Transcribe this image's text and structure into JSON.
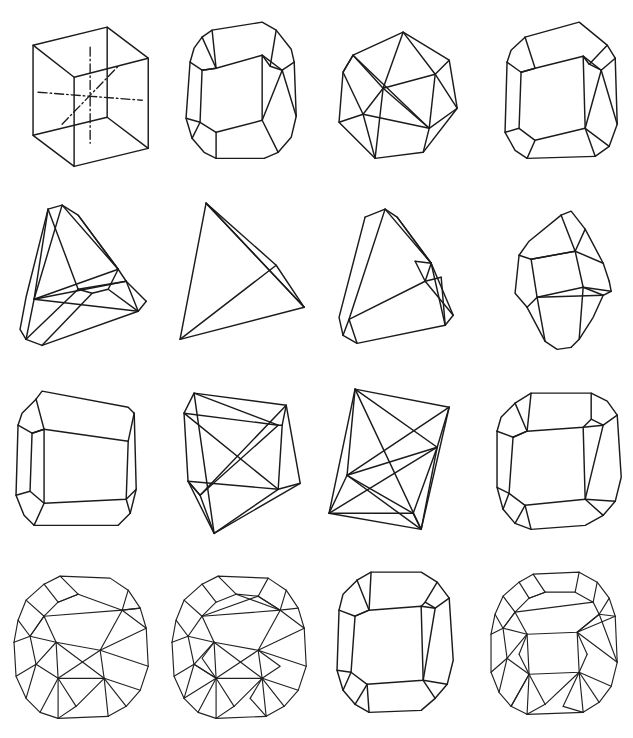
{
  "plate": {
    "title": "",
    "width": 633,
    "height": 738,
    "background_color": "#ffffff",
    "line_color": "#1b1b1b",
    "rows": 4,
    "columns": 4,
    "figure_count": 16
  },
  "figures": [
    {
      "index": 1,
      "row": 1,
      "column": 1,
      "name": "cube-with-symmetry-axes",
      "label": "",
      "form": "hexahedron",
      "has_axes": true,
      "axis_style": "dash-dot"
    },
    {
      "index": 2,
      "row": 1,
      "column": 2,
      "name": "truncated-cube",
      "label": "",
      "form": "cube with bevelled edges and corners",
      "has_axes": false,
      "axis_style": ""
    },
    {
      "index": 3,
      "row": 1,
      "column": 3,
      "name": "cuboctahedron",
      "label": "",
      "form": "cuboctahedron wireframe",
      "has_axes": false,
      "axis_style": ""
    },
    {
      "index": 4,
      "row": 1,
      "column": 4,
      "name": "corner-truncated-cube",
      "label": "",
      "form": "cube with truncated corners",
      "has_axes": false,
      "axis_style": ""
    },
    {
      "index": 5,
      "row": 2,
      "column": 1,
      "name": "bevelled-tetrahedron",
      "label": "",
      "form": "tetrahedron with bevelled edges",
      "has_axes": false,
      "axis_style": ""
    },
    {
      "index": 6,
      "row": 2,
      "column": 2,
      "name": "tetrahedron",
      "label": "",
      "form": "simple tetrahedron",
      "has_axes": false,
      "axis_style": ""
    },
    {
      "index": 7,
      "row": 2,
      "column": 3,
      "name": "truncated-tetrahedron",
      "label": "",
      "form": "tetrahedron with one truncated corner",
      "has_axes": false,
      "axis_style": ""
    },
    {
      "index": 8,
      "row": 2,
      "column": 4,
      "name": "small-dipyramid",
      "label": "",
      "form": "truncated dipyramidal crystal",
      "has_axes": false,
      "axis_style": ""
    },
    {
      "index": 9,
      "row": 3,
      "column": 1,
      "name": "corner-clipped-cube",
      "label": "",
      "form": "cube with clipped corners",
      "has_axes": false,
      "axis_style": ""
    },
    {
      "index": 10,
      "row": 3,
      "column": 2,
      "name": "cube-with-face-diagonals",
      "label": "",
      "form": "cube with face diagonal edges",
      "has_axes": false,
      "axis_style": ""
    },
    {
      "index": 11,
      "row": 3,
      "column": 3,
      "name": "tetragonal-disphenoid",
      "label": "",
      "form": "elongated form with crossing diagonals",
      "has_axes": false,
      "axis_style": ""
    },
    {
      "index": 12,
      "row": 3,
      "column": 4,
      "name": "bevelled-cube-variant",
      "label": "",
      "form": "cube with bevelled edges, oblique view",
      "has_axes": false,
      "axis_style": ""
    },
    {
      "index": 13,
      "row": 4,
      "column": 1,
      "name": "complex-trapezohedron",
      "label": "",
      "form": "multi-faceted crystal habit",
      "has_axes": false,
      "axis_style": ""
    },
    {
      "index": 14,
      "row": 4,
      "column": 2,
      "name": "complex-hexoctahedron",
      "label": "",
      "form": "densely faceted crystal habit",
      "has_axes": false,
      "axis_style": ""
    },
    {
      "index": 15,
      "row": 4,
      "column": 3,
      "name": "edge-truncated-cube",
      "label": "",
      "form": "cube with truncated vertical edges",
      "has_axes": false,
      "axis_style": ""
    },
    {
      "index": 16,
      "row": 4,
      "column": 4,
      "name": "rhombicuboctahedron",
      "label": "",
      "form": "rhombicuboctahedron wireframe",
      "has_axes": false,
      "axis_style": ""
    }
  ]
}
